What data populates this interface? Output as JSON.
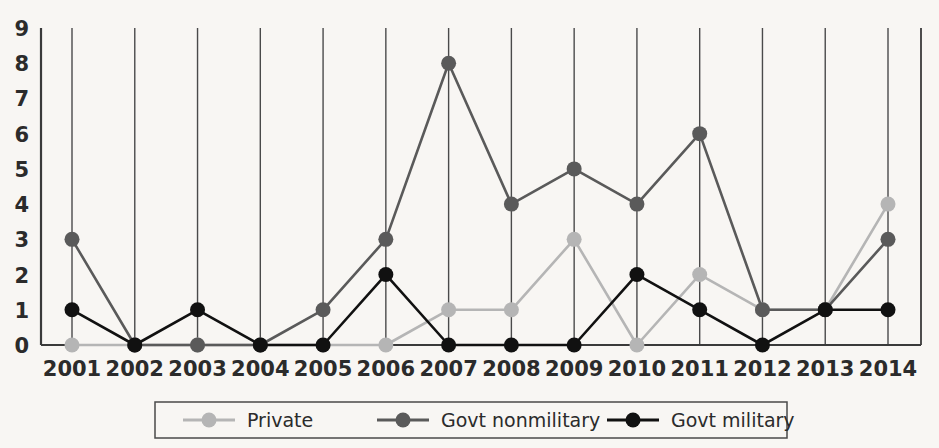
{
  "chart_data": {
    "type": "line",
    "title": "",
    "subtitle": "",
    "xlabel": "",
    "ylabel": "",
    "categories": [
      "2001",
      "2002",
      "2003",
      "2004",
      "2005",
      "2006",
      "2007",
      "2008",
      "2009",
      "2010",
      "2011",
      "2012",
      "2013",
      "2014"
    ],
    "x_tick_labels": [
      "2001",
      "2002",
      "2003",
      "2004",
      "2005",
      "2006",
      "2007",
      "2008",
      "2009",
      "2010",
      "2011",
      "2012",
      "2013",
      "2014"
    ],
    "y_tick_labels": [
      "0",
      "1",
      "2",
      "3",
      "4",
      "5",
      "6",
      "7",
      "8",
      "9"
    ],
    "ylim": [
      0,
      9
    ],
    "y_ticks": [
      0,
      1,
      2,
      3,
      4,
      5,
      6,
      7,
      8,
      9
    ],
    "grid": "vertical-only",
    "legend_position": "bottom",
    "series": [
      {
        "name": "Private",
        "color": "#b5b5b5",
        "marker": "circle",
        "values": [
          0,
          0,
          0,
          0,
          0,
          0,
          1,
          1,
          3,
          0,
          2,
          1,
          1,
          4
        ]
      },
      {
        "name": "Govt nonmilitary",
        "color": "#5a5a5a",
        "marker": "circle",
        "values": [
          3,
          0,
          0,
          0,
          1,
          3,
          8,
          4,
          5,
          4,
          6,
          1,
          1,
          3
        ]
      },
      {
        "name": "Govt military",
        "color": "#111111",
        "marker": "circle",
        "values": [
          1,
          0,
          1,
          0,
          0,
          2,
          0,
          0,
          0,
          2,
          1,
          0,
          1,
          1
        ]
      }
    ]
  },
  "legend": {
    "entries": [
      {
        "label": "Private"
      },
      {
        "label": "Govt nonmilitary"
      },
      {
        "label": "Govt military"
      }
    ]
  },
  "colors": {
    "private": "#b5b5b5",
    "govt_nonmilitary": "#5a5a5a",
    "govt_military": "#111111",
    "axis": "#3a3a3a",
    "gridline": "#4a4a4a",
    "background": "#f8f6f3"
  }
}
